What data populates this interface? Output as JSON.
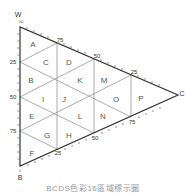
{
  "vertices": {
    "W": "W",
    "B": "B",
    "C": "C"
  },
  "left_axis_ticks": [
    "25",
    "50",
    "75"
  ],
  "top_axis_ticks": [
    "75",
    "50",
    "25"
  ],
  "bottom_axis_ticks": [
    "25",
    "50",
    "75"
  ],
  "top_vertex_value": "100",
  "bottom_vertex_value": "0",
  "right_vertex_value": "0",
  "regions": [
    "A",
    "B",
    "C",
    "D",
    "E",
    "F",
    "G",
    "H",
    "I",
    "J",
    "K",
    "L",
    "M",
    "N",
    "O",
    "P"
  ],
  "region_labels": {
    "A": "A",
    "B": "B",
    "C": "C",
    "D": "D",
    "E": "E",
    "F": "F",
    "G": "G",
    "H": "H",
    "I": "I",
    "J": "J",
    "K": "K",
    "L": "L",
    "M": "M",
    "N": "N",
    "O": "O",
    "P": "P"
  },
  "caption": "BCDS色彩16區域標示圖"
}
